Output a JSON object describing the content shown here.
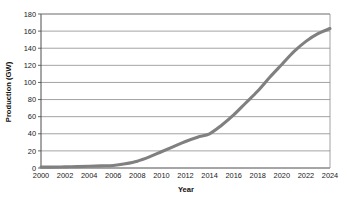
{
  "chart_data": {
    "type": "line",
    "title": "",
    "xlabel": "Year",
    "ylabel": "Production (GW)",
    "xlim": [
      2000,
      2024
    ],
    "ylim": [
      0,
      180
    ],
    "grid": "horizontal",
    "legend": "none",
    "line_color": "#808080",
    "x": [
      2000,
      2001,
      2002,
      2003,
      2004,
      2005,
      2006,
      2007,
      2008,
      2009,
      2010,
      2011,
      2012,
      2013,
      2014,
      2015,
      2016,
      2017,
      2018,
      2019,
      2020,
      2021,
      2022,
      2023,
      2024
    ],
    "xtick_labels": [
      "2000",
      "2002",
      "2004",
      "2006",
      "2008",
      "2010",
      "2012",
      "2014",
      "2016",
      "2018",
      "2020",
      "2022",
      "2024"
    ],
    "xticks": [
      2000,
      2002,
      2004,
      2006,
      2008,
      2010,
      2012,
      2014,
      2016,
      2018,
      2020,
      2022,
      2024
    ],
    "ytick_labels": [
      "0",
      "20",
      "40",
      "60",
      "80",
      "100",
      "120",
      "140",
      "160",
      "180"
    ],
    "yticks": [
      0,
      20,
      40,
      60,
      80,
      100,
      120,
      140,
      160,
      180
    ],
    "series": [
      {
        "name": "Production",
        "values": [
          1,
          1,
          1.3,
          1.6,
          2,
          2.5,
          3,
          5,
          8,
          13,
          19,
          25,
          31,
          36,
          40,
          50,
          62,
          76,
          90,
          106,
          121,
          136,
          148,
          157,
          163
        ]
      }
    ]
  }
}
